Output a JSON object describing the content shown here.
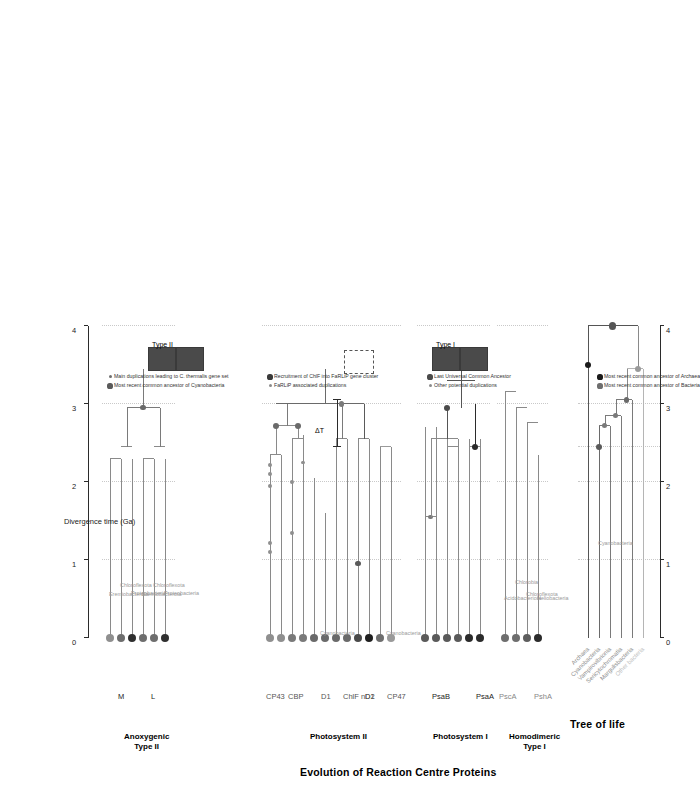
{
  "figure": {
    "title_main": "Evolution of Reaction Centre Proteins",
    "title_tree": "Tree of life"
  },
  "axes": {
    "caption": "Divergence time (Ga)",
    "ticks": [
      "0",
      "1",
      "2",
      "3",
      "4"
    ],
    "tick_values": [
      0,
      1,
      2,
      3,
      4
    ],
    "range": [
      0,
      4.15
    ]
  },
  "tree_of_life": {
    "tips": [
      "Archaea",
      "Cyanobacteria",
      "Vampirovibrionia",
      "Sericytochromatia",
      "Margulisbacteria",
      "Other bacteria"
    ],
    "inline_labels": [
      "Cyanobacteria"
    ],
    "nodes": [
      {
        "name": "mrca-archaea",
        "time": 3.5,
        "kind": "archaea"
      },
      {
        "name": "luca",
        "time": 4.0,
        "kind": "luca"
      },
      {
        "name": "mrca-cyanobacteria",
        "time": 2.45,
        "kind": "cyano"
      },
      {
        "name": "node-vampiro",
        "time": 2.72,
        "kind": "cyano"
      },
      {
        "name": "node-sericyto",
        "time": 2.85,
        "kind": "cyano"
      },
      {
        "name": "node-margulis",
        "time": 3.05,
        "kind": "bacteria"
      },
      {
        "name": "mrca-bacteria",
        "time": 3.45,
        "kind": "bacteria"
      }
    ]
  },
  "panels": [
    {
      "name": "homodimeric-type-i",
      "title": "Homodimeric\nType I",
      "genes": [
        "PshA",
        "PscA"
      ],
      "taxa": [
        "Heliobacteria",
        "Chloroflexota",
        "Chlorobia",
        "Acidobacteriota"
      ]
    },
    {
      "name": "photosystem-i",
      "title": "Photosystem I",
      "genes": [
        "PsaA",
        "PsaB"
      ],
      "taxa": [
        "Cyanobacteria"
      ]
    },
    {
      "name": "photosystem-ii",
      "title": "Photosystem II",
      "genes": [
        "CP47",
        "D2",
        "ChlF nD1",
        "D1",
        "CBP",
        "CP43"
      ],
      "taxa": [
        "Cyanobacteria"
      ]
    },
    {
      "name": "anoxygenic-type-ii",
      "title": "Anoxygenic\nType II",
      "genes": [
        "L",
        "M"
      ],
      "taxa": [
        "Proteobacteria",
        "Chloroflexota",
        "Eremiobacterota"
      ]
    }
  ],
  "clade_boxes": [
    {
      "name": "type-i-box",
      "label": "Type I",
      "style": "filled"
    },
    {
      "name": "type-ii-box",
      "label": "Type II",
      "style": "filled"
    },
    {
      "name": "unfilled-box",
      "label": "",
      "style": "hollow"
    }
  ],
  "delta_t": {
    "label": "ΔT"
  },
  "legend": {
    "groups": [
      {
        "name": "tree-of-life-legend",
        "items": [
          {
            "label": "Most recent common ancestor of Bacteria",
            "color": "#6e6e6e",
            "size": "large"
          },
          {
            "label": "Most recent common ancestor of Archaea",
            "color": "#1a1a1a",
            "size": "large"
          }
        ]
      },
      {
        "name": "duplication-legend",
        "items": [
          {
            "label": "Other potential duplications",
            "color": "#8a8a8a",
            "size": "small"
          },
          {
            "label": "Last Universal Common Ancestor",
            "color": "#4a4a4a",
            "size": "large"
          }
        ]
      },
      {
        "name": "farlip-legend",
        "items": [
          {
            "label": "FaRLiP associated duplications",
            "color": "#8a8a8a",
            "size": "small"
          },
          {
            "label": "Recruitment of ChlF into FaRLiP gene cluster",
            "color": "#3a3a3a",
            "size": "large"
          }
        ]
      },
      {
        "name": "cyanobacteria-legend",
        "items": [
          {
            "label": "Most recent common ancestor of Cyanobacteria",
            "color": "#5a5a5a",
            "size": "large"
          },
          {
            "label": "Main duplications leading to C. thermalis gene set",
            "color": "#6e6e6e",
            "size": "small"
          }
        ]
      }
    ]
  }
}
